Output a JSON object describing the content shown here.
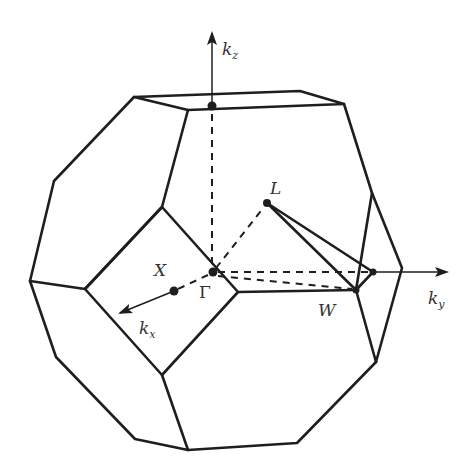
{
  "figure": {
    "axes": {
      "kz": {
        "main": "k",
        "sub": "z"
      },
      "kx": {
        "main": "k",
        "sub": "x"
      },
      "ky": {
        "main": "k",
        "sub": "y"
      }
    },
    "points": {
      "gamma": "Γ",
      "X": "X",
      "L": "L",
      "W": "W"
    },
    "colors": {
      "line": "#1e1e1e",
      "text": "#333333",
      "background": "#ffffff"
    }
  }
}
